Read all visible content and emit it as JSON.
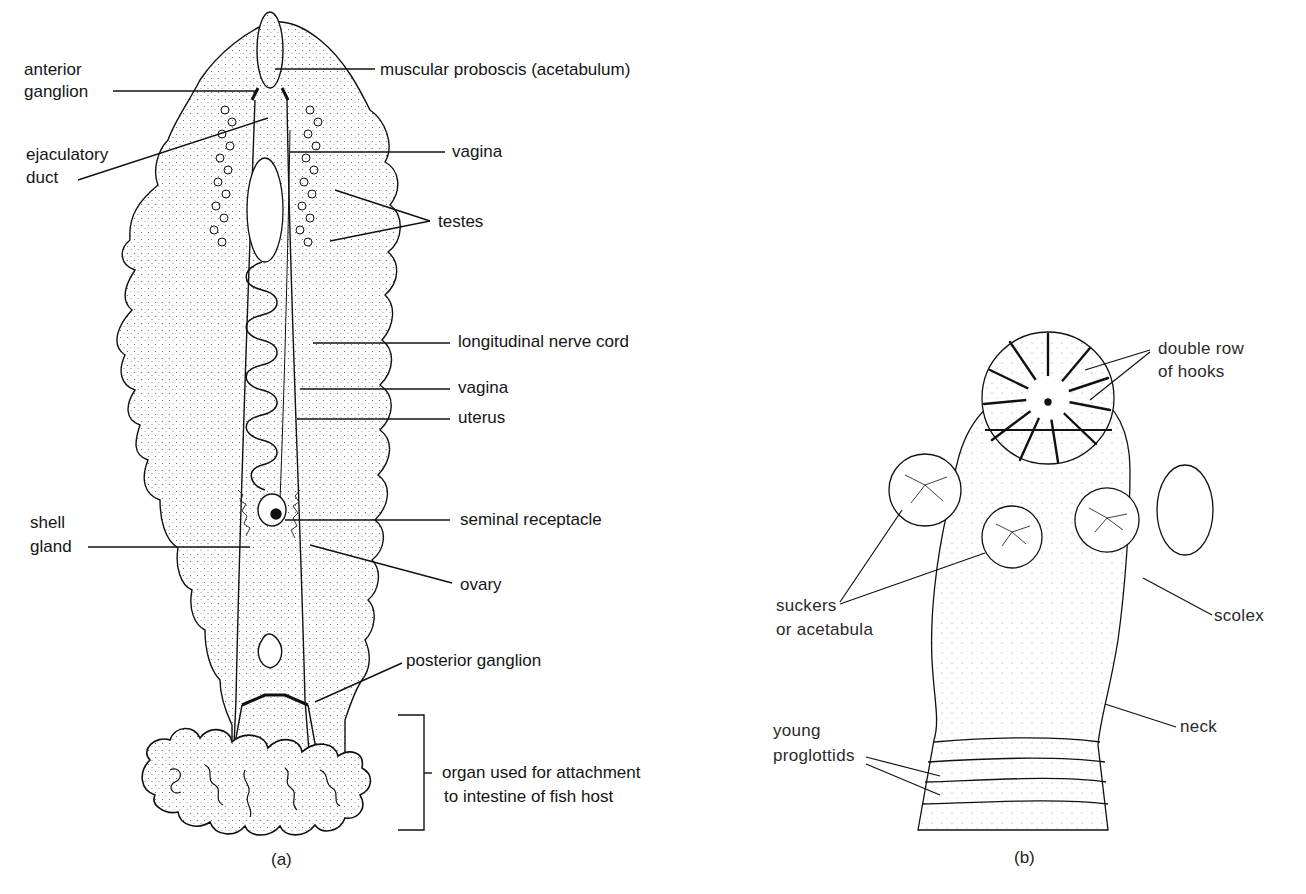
{
  "figure_a": {
    "caption": "(a)",
    "labels": {
      "anterior_ganglion_1": "anterior",
      "anterior_ganglion_2": "ganglion",
      "muscular_proboscis": "muscular proboscis (acetabulum)",
      "ejaculatory_duct_1": "ejaculatory",
      "ejaculatory_duct_2": "duct",
      "vagina_upper": "vagina",
      "testes": "testes",
      "longitudinal_nerve_cord": "longitudinal nerve cord",
      "vagina_lower": "vagina",
      "uterus": "uterus",
      "shell_gland_1": "shell",
      "shell_gland_2": "gland",
      "seminal_receptacle": "seminal receptacle",
      "ovary": "ovary",
      "posterior_ganglion": "posterior ganglion",
      "attachment_organ_1": "organ used for attachment",
      "attachment_organ_2": "to  intestine of fish host"
    }
  },
  "figure_b": {
    "caption": "(b)",
    "labels": {
      "hooks_1": "double row",
      "hooks_2": "of hooks",
      "suckers_1": "suckers",
      "suckers_2": "or acetabula",
      "scolex": "scolex",
      "neck": "neck",
      "proglottids_1": "young",
      "proglottids_2": "proglottids"
    }
  }
}
